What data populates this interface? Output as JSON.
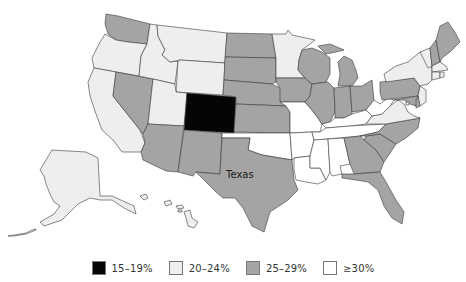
{
  "map": {
    "title_fragment": "",
    "label": "Texas",
    "legend": [
      {
        "label": "15–19%",
        "color": "#050505",
        "class": "c-black"
      },
      {
        "label": "20–24%",
        "color": "#eeeeee",
        "class": "c-light"
      },
      {
        "label": "25–29%",
        "color": "#a4a4a4",
        "class": "c-gray"
      },
      {
        "label": "≥30%",
        "color": "#ffffff",
        "class": "c-white"
      }
    ],
    "states": {
      "WA": "25–29%",
      "OR": "20–24%",
      "CA": "20–24%",
      "NV": "25–29%",
      "ID": "20–24%",
      "MT": "20–24%",
      "WY": "20–24%",
      "UT": "20–24%",
      "CO": "15–19%",
      "AZ": "25–29%",
      "NM": "25–29%",
      "ND": "25–29%",
      "SD": "25–29%",
      "NE": "25–29%",
      "KS": "25–29%",
      "OK": "≥30%",
      "TX": "25–29%",
      "MN": "20–24%",
      "IA": "25–29%",
      "MO": "≥30%",
      "AR": "≥30%",
      "LA": "≥30%",
      "WI": "25–29%",
      "IL": "25–29%",
      "MI": "25–29%",
      "IN": "25–29%",
      "OH": "25–29%",
      "KY": "≥30%",
      "TN": "≥30%",
      "MS": "≥30%",
      "AL": "≥30%",
      "GA": "25–29%",
      "FL": "25–29%",
      "SC": "25–29%",
      "NC": "25–29%",
      "VA": "20–24%",
      "WV": "≥30%",
      "PA": "25–29%",
      "NY": "20–24%",
      "VT": "20–24%",
      "NH": "25–29%",
      "ME": "25–29%",
      "MA": "20–24%",
      "RI": "20–24%",
      "CT": "20–24%",
      "NJ": "20–24%",
      "DE": "25–29%",
      "MD": "25–29%",
      "DC": "20–24%",
      "AK": "20–24%",
      "HI": "20–24%"
    }
  }
}
